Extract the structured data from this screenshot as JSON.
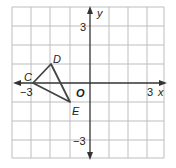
{
  "axes": {
    "x_label": "x",
    "y_label": "y",
    "origin_label": "O",
    "x_ticks": {
      "neg": "−3",
      "pos": "3"
    },
    "y_ticks": {
      "pos": "3",
      "neg": "−3"
    }
  },
  "triangle": {
    "vertices": [
      {
        "name": "C",
        "x": -3,
        "y": 0
      },
      {
        "name": "D",
        "x": -2,
        "y": 1
      },
      {
        "name": "E",
        "x": -1,
        "y": -1
      }
    ]
  },
  "grid": {
    "min": -4,
    "max": 4
  }
}
